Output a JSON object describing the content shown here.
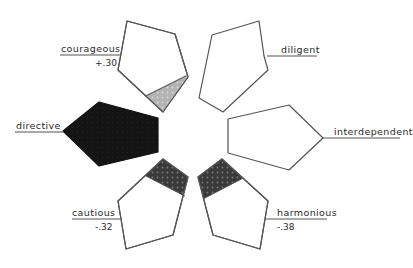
{
  "diagram": {
    "type": "pentagon-petal-profile",
    "colors": {
      "outline": "#555555",
      "background": "#ffffff",
      "fill_dark": "#1a1a1a",
      "fill_medium": "#3a3a3a",
      "fill_light": "#b5b5b5",
      "label_text": "#2a2a2a"
    },
    "traits": [
      {
        "id": "courageous",
        "label": "courageous",
        "value": "+.30",
        "fill": "light-partial"
      },
      {
        "id": "diligent",
        "label": "diligent",
        "value": "",
        "fill": "none"
      },
      {
        "id": "interdependent",
        "label": "interdependent",
        "value": "",
        "fill": "none"
      },
      {
        "id": "harmonious",
        "label": "harmonious",
        "value": "-.38",
        "fill": "dark-partial"
      },
      {
        "id": "cautious",
        "label": "cautious",
        "value": "-.32",
        "fill": "dark-partial"
      },
      {
        "id": "directive",
        "label": "directive",
        "value": "",
        "fill": "solid-dark"
      }
    ]
  }
}
